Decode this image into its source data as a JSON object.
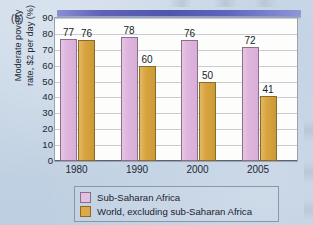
{
  "figure": {
    "panel_label": "(b)",
    "background_color": "#c5d4e5"
  },
  "legend": {
    "position": "bottom-center",
    "entries": [
      {
        "label": "Sub-Saharan Africa",
        "color": "#e3bfe2",
        "swatch": "legend-swatch-sub-saharan-africa"
      },
      {
        "label": "World, excluding sub-Saharan Africa",
        "color": "#dda94a",
        "swatch": "legend-swatch-world-excluding"
      }
    ]
  },
  "chart_data": {
    "type": "bar",
    "title": "",
    "subtitle": "",
    "xlabel": "",
    "ylabel_line1": "Moderate poverty",
    "ylabel_line2": "rate, $2 per day (%)",
    "ylabel": "Moderate poverty rate, $2 per day (%)",
    "categories": [
      "1980",
      "1990",
      "2000",
      "2005"
    ],
    "series": [
      {
        "name": "Sub-Saharan Africa",
        "color": "#e3bfe2",
        "values": [
          77,
          78,
          76,
          72
        ],
        "labels": [
          "77",
          "78",
          "76",
          "72"
        ]
      },
      {
        "name": "World, excluding sub-Saharan Africa",
        "color": "#dda94a",
        "values": [
          76,
          60,
          50,
          41
        ],
        "labels": [
          "76",
          "60",
          "50",
          "41"
        ]
      }
    ],
    "ylim": [
      0,
      90
    ],
    "ytick_step": 10,
    "yticks": [
      90,
      80,
      70,
      60,
      50,
      40,
      30,
      20,
      10,
      0
    ],
    "ytick_labels": [
      "90",
      "80",
      "70",
      "60",
      "50",
      "40",
      "30",
      "20",
      "10",
      "0"
    ],
    "grid": true,
    "grid_axis": "y",
    "legend_position": "bottom"
  }
}
